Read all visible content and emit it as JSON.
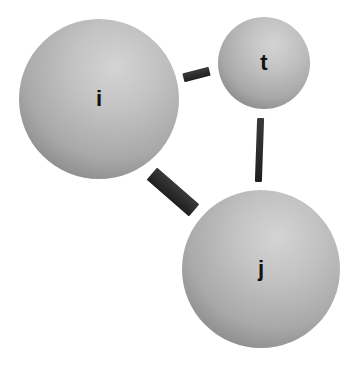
{
  "diagram": {
    "nodes": [
      {
        "id": "i",
        "label": "i",
        "cx": 99,
        "cy": 99,
        "r": 80
      },
      {
        "id": "t",
        "label": "t",
        "cx": 264,
        "cy": 63,
        "r": 46
      },
      {
        "id": "j",
        "label": "j",
        "cx": 261,
        "cy": 269,
        "r": 79
      }
    ],
    "edges": [
      {
        "from": "i",
        "to": "t",
        "thickness": "medium"
      },
      {
        "from": "t",
        "to": "j",
        "thickness": "thin"
      },
      {
        "from": "i",
        "to": "j",
        "thickness": "thick"
      }
    ],
    "colors": {
      "sphere_highlight": "#d4d4d4",
      "sphere_shadow": "#5c5c5c",
      "bond": "#262626",
      "label": "#111111",
      "background": "#ffffff"
    }
  }
}
